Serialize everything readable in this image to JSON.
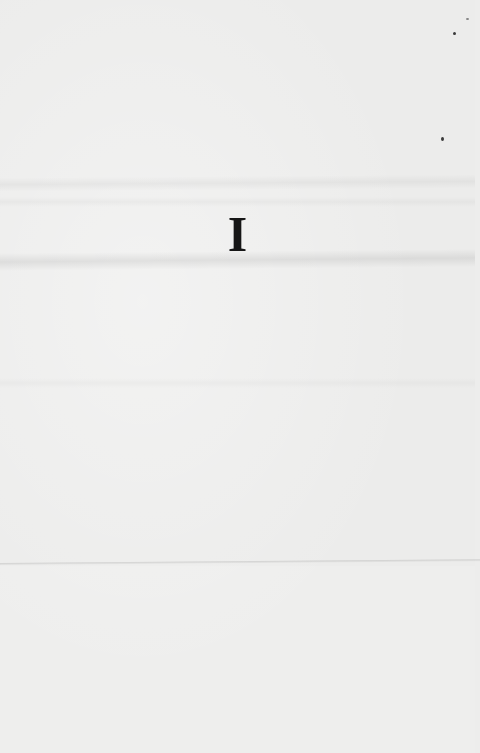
{
  "document": {
    "type": "scanned-page",
    "section_heading": "I",
    "paper_color": "#ececeb",
    "ink_color": "#161616"
  }
}
